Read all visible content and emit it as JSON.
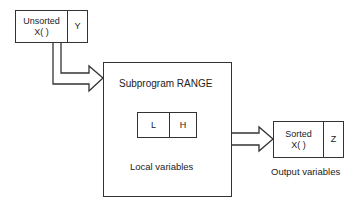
{
  "input_box": {
    "array_cell": {
      "line1": "Unsorted",
      "line2": "X( )"
    },
    "scalar_cell": "Y"
  },
  "subprogram": {
    "title": "Subprogram  RANGE",
    "local_box": {
      "left_cell": "L",
      "right_cell": "H"
    },
    "caption": "Local variables"
  },
  "output_box": {
    "array_cell": {
      "line1": "Sorted",
      "line2": "X( )"
    },
    "scalar_cell": "Z"
  },
  "output_caption": "Output variables",
  "colors": {
    "line": "#333333",
    "background": "#ffffff",
    "text": "#222222"
  }
}
